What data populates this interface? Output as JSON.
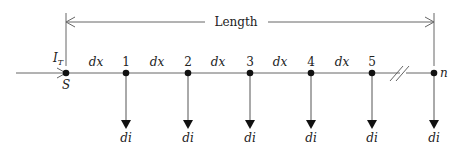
{
  "diagram": {
    "length_label": "Length",
    "source_current_label": "I",
    "source_current_subscript": "T",
    "source_node_label": "S",
    "segment_label": "dx",
    "drop_label": "di",
    "nodes": [
      {
        "label": "1"
      },
      {
        "label": "2"
      },
      {
        "label": "3"
      },
      {
        "label": "4"
      },
      {
        "label": "5"
      },
      {
        "label": "n"
      }
    ],
    "colors": {
      "line": "#555555",
      "node": "#111111"
    }
  }
}
